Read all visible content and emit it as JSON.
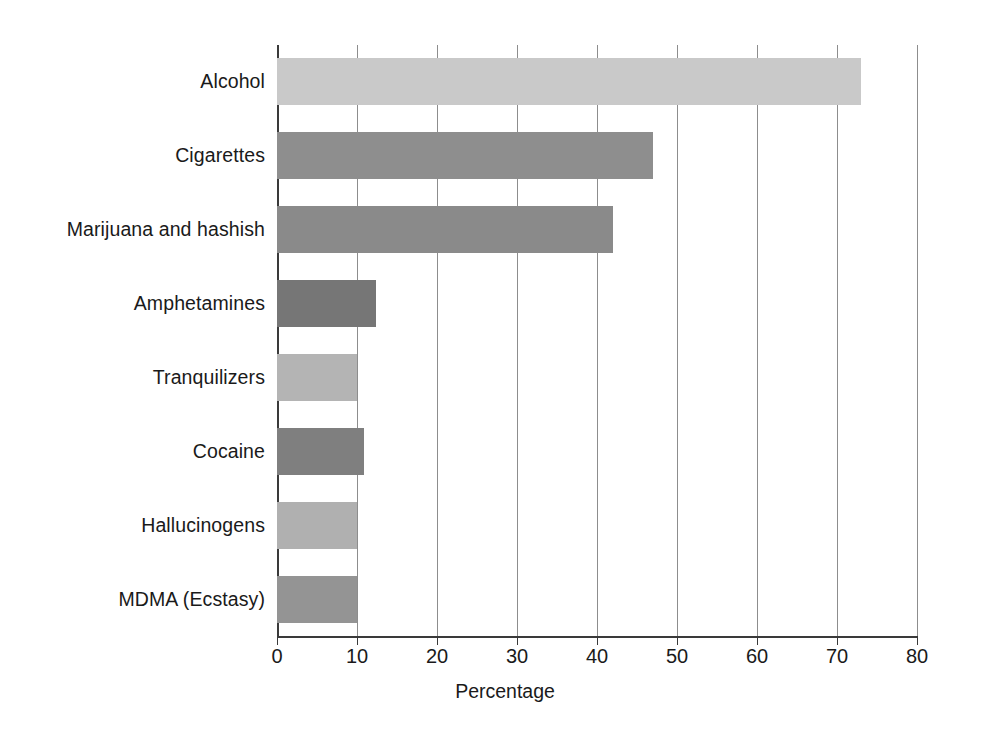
{
  "chart_data": {
    "type": "bar",
    "orientation": "horizontal",
    "title": "",
    "subtitle": "",
    "xlabel": "Percentage",
    "ylabel": "",
    "categories": [
      "Alcohol",
      "Cigarettes",
      "Marijuana and hashish",
      "Amphetamines",
      "Tranquilizers",
      "Cocaine",
      "Hallucinogens",
      "MDMA (Ecstasy)"
    ],
    "values": [
      73,
      47,
      42,
      12.4,
      10,
      10.9,
      10,
      10
    ],
    "bar_colors": [
      "#c9c9c9",
      "#8e8e8e",
      "#8a8a8a",
      "#767676",
      "#b4b4b4",
      "#7f7f7f",
      "#b0b0b0",
      "#949494"
    ],
    "xlim": [
      0,
      80
    ],
    "xticks": [
      0,
      10,
      20,
      30,
      40,
      50,
      60,
      70,
      80
    ],
    "xtick_labels": [
      "0",
      "10",
      "20",
      "30",
      "40",
      "50",
      "60",
      "70",
      "80"
    ],
    "grid": "vertical",
    "gridline_color": "#8d8d8d",
    "axis_color": "#3a3a3a",
    "legend": "none",
    "background": "#ffffff"
  }
}
